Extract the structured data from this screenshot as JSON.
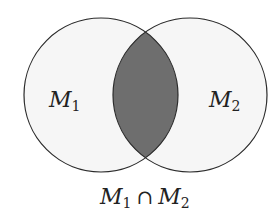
{
  "diagram": {
    "type": "venn",
    "sets": [
      {
        "name": "M",
        "subscript": "1",
        "cx": 101,
        "cy": 95,
        "r": 77
      },
      {
        "name": "M",
        "subscript": "2",
        "cx": 190,
        "cy": 95,
        "r": 77
      }
    ],
    "intersection_label": {
      "left_name": "M",
      "left_sub": "1",
      "operator": "∩",
      "right_name": "M",
      "right_sub": "2"
    },
    "colors": {
      "circle_fill": "#f6f6f6",
      "intersection_fill": "#6e6e6e",
      "stroke": "#2a2a2a"
    }
  }
}
